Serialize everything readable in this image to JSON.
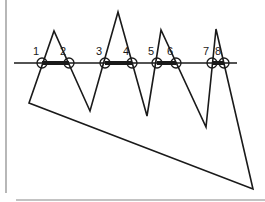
{
  "diagram": {
    "colors": {
      "stroke": "#1a1a1a",
      "frame": "#888888",
      "background": "#ffffff"
    },
    "line": {
      "y": 63,
      "x1": 14,
      "x2": 237
    },
    "polygon": [
      [
        29,
        103
      ],
      [
        54,
        31
      ],
      [
        90,
        111
      ],
      [
        118,
        12
      ],
      [
        147,
        116
      ],
      [
        161,
        30
      ],
      [
        206,
        127
      ],
      [
        216,
        29
      ],
      [
        253,
        189
      ]
    ],
    "intersections": [
      {
        "label": "1",
        "x": 42,
        "y": 63
      },
      {
        "label": "2",
        "x": 69,
        "y": 63
      },
      {
        "label": "3",
        "x": 105,
        "y": 63
      },
      {
        "label": "4",
        "x": 132,
        "y": 63
      },
      {
        "label": "5",
        "x": 157,
        "y": 63
      },
      {
        "label": "6",
        "x": 176,
        "y": 63
      },
      {
        "label": "7",
        "x": 212,
        "y": 63
      },
      {
        "label": "8",
        "x": 224,
        "y": 63
      }
    ],
    "highlighted_spans": [
      [
        42,
        69
      ],
      [
        105,
        132
      ],
      [
        157,
        176
      ],
      [
        212,
        224
      ]
    ]
  }
}
